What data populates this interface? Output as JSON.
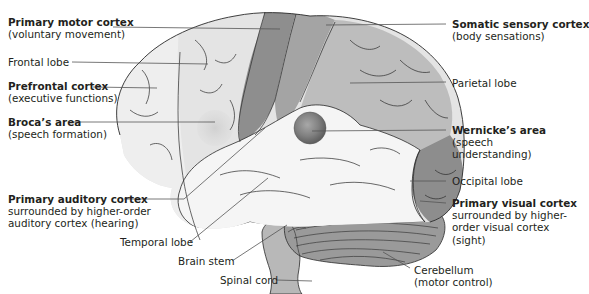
{
  "colors": {
    "frontal": "#e4e4e4",
    "prefrontal": "#eeeeee",
    "motor": "#8e8e8e",
    "sensory": "#a4a4a4",
    "parietal": "#bdbdbd",
    "occipital": "#8d8d8d",
    "temporal": "#f5f5f5",
    "wernicke": "#7c7c7c",
    "broca": "#d3d3d3",
    "cerebellum": "#9a9a9a",
    "brainstem": "#b8b8b8",
    "sulcus_line": "#2a2a2a",
    "leader_line": "#555555",
    "text": "#231f20"
  },
  "labels": {
    "primary_motor": {
      "title": "Primary motor cortex",
      "desc": "(voluntary movement)"
    },
    "frontal_lobe": {
      "title": "Frontal lobe"
    },
    "prefrontal": {
      "title": "Prefrontal cortex",
      "desc": "(executive functions)"
    },
    "broca": {
      "title": "Broca’s area",
      "desc": "(speech formation)"
    },
    "primary_auditory": {
      "title": "Primary auditory cortex",
      "desc1": "surrounded by higher-order",
      "desc2": "auditory cortex (hearing)"
    },
    "temporal_lobe": {
      "title": "Temporal lobe"
    },
    "brain_stem": {
      "title": "Brain stem"
    },
    "spinal_cord": {
      "title": "Spinal cord"
    },
    "somatic_sensory": {
      "title": "Somatic sensory cortex",
      "desc": "(body sensations)"
    },
    "parietal_lobe": {
      "title": "Parietal lobe"
    },
    "wernicke": {
      "title": "Wernicke’s area",
      "desc1": "(speech",
      "desc2": "understanding)"
    },
    "occipital_lobe": {
      "title": "Occipital lobe"
    },
    "primary_visual": {
      "title": "Primary visual cortex",
      "desc1": "surrounded by higher-",
      "desc2": "order visual cortex",
      "desc3": "(sight)"
    },
    "cerebellum": {
      "title": "Cerebellum",
      "desc": "(motor control)"
    }
  }
}
